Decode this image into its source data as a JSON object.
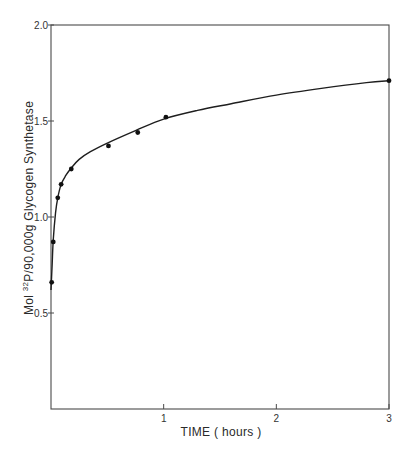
{
  "chart_data": {
    "type": "scatter",
    "title": "",
    "xlabel": "TIME ( hours )",
    "ylabel": "Mol ³²P/90,000g  Glycogen Synthetase",
    "ylabel_parts": {
      "prefix": "Mol ",
      "superscript": "32",
      "main": "P/90,000g  Glycogen Synthetase"
    },
    "xlim": [
      0,
      3
    ],
    "ylim": [
      0,
      2.0
    ],
    "x_ticks": [
      1,
      2,
      3
    ],
    "x_tick_labels": [
      "1",
      "2",
      "3"
    ],
    "y_ticks": [
      0.5,
      1.0,
      1.5,
      2.0
    ],
    "y_tick_labels": [
      "0.5",
      "1.0",
      "1.5",
      "2.0"
    ],
    "grid": false,
    "legend": null,
    "frame": "box",
    "series": [
      {
        "name": "32P incorporation",
        "marker": "filled-circle",
        "line": "smooth-fit",
        "x": [
          0.006,
          0.02,
          0.06,
          0.09,
          0.18,
          0.51,
          0.77,
          1.02,
          3.0
        ],
        "y": [
          0.66,
          0.87,
          1.1,
          1.17,
          1.25,
          1.37,
          1.44,
          1.52,
          1.71
        ]
      }
    ],
    "fit_curve": {
      "x": [
        0.0,
        0.01,
        0.02,
        0.04,
        0.06,
        0.09,
        0.13,
        0.18,
        0.25,
        0.35,
        0.5,
        0.75,
        1.0,
        1.3,
        1.6,
        2.0,
        2.4,
        2.8,
        3.0
      ],
      "y": [
        0.62,
        0.75,
        0.88,
        1.02,
        1.1,
        1.17,
        1.215,
        1.255,
        1.3,
        1.34,
        1.385,
        1.45,
        1.51,
        1.555,
        1.59,
        1.635,
        1.67,
        1.7,
        1.71
      ]
    }
  },
  "colors": {
    "axis": "#4a4a4a",
    "curve": "#1e1e1e",
    "points": "#111111",
    "background": "#ffffff"
  }
}
